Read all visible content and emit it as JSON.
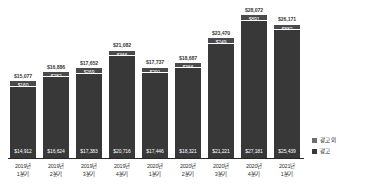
{
  "chart_data": {
    "type": "bar",
    "subtype": "stacked-vertical",
    "title": "",
    "xlabel": "",
    "ylabel": "",
    "grid": false,
    "ylim": [
      0,
      28072
    ],
    "legend_position": "right",
    "currency_symbol": "$",
    "categories": [
      {
        "year": "2019년",
        "quarter": "1분기"
      },
      {
        "year": "2019년",
        "quarter": "2분기"
      },
      {
        "year": "2019년",
        "quarter": "3분기"
      },
      {
        "year": "2019년",
        "quarter": "4분기"
      },
      {
        "year": "2020년",
        "quarter": "1분기"
      },
      {
        "year": "2020년",
        "quarter": "2분기"
      },
      {
        "year": "2020년",
        "quarter": "3분기"
      },
      {
        "year": "2020년",
        "quarter": "4분기"
      },
      {
        "year": "2021년",
        "quarter": "1분기"
      }
    ],
    "series": [
      {
        "name": "광고 외",
        "color": "#4a4a4a",
        "values": [
          160,
          282,
          269,
          366,
          291,
          366,
          249,
          891,
          882
        ],
        "labels": [
          "$160",
          "$282",
          "$269",
          "$366",
          "$291",
          "$366",
          "$249",
          "$891",
          "$882"
        ]
      },
      {
        "name": "광고",
        "color": "#383838",
        "values": [
          14912,
          16624,
          17383,
          20716,
          17446,
          18321,
          21221,
          27181,
          25439
        ],
        "labels": [
          "$14,912",
          "$16,624",
          "$17,383",
          "$20,716",
          "$17,446",
          "$18,321",
          "$21,221",
          "$27,181",
          "$25,439"
        ]
      }
    ],
    "totals": [
      15077,
      16886,
      17652,
      21082,
      17737,
      18687,
      23470,
      28072,
      26171
    ],
    "total_labels": [
      "$15,077",
      "$16,886",
      "$17,652",
      "$21,082",
      "$17,737",
      "$18,687",
      "$23,470",
      "$28,072",
      "$26,171"
    ]
  },
  "legend": {
    "items": [
      {
        "label": "광고 외",
        "color": "#6e6e6e"
      },
      {
        "label": "광고",
        "color": "#383838"
      }
    ]
  }
}
